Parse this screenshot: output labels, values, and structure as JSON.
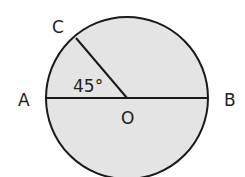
{
  "diagram": {
    "type": "circle-geometry",
    "labels": {
      "A": "A",
      "B": "B",
      "C": "C",
      "O": "O"
    },
    "angle_label": "45°",
    "angle_AOC_degrees": 45,
    "fill_color": "#e4e4e4",
    "stroke_color": "#1a1a1a"
  }
}
